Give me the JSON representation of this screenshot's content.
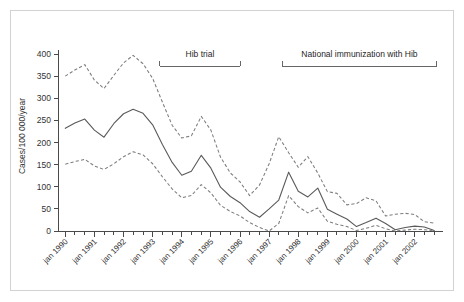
{
  "figure": {
    "background_color": "#ffffff",
    "frame_color": "#d2d2d2"
  },
  "chart_data": {
    "type": "line",
    "title": "",
    "subtitle": "",
    "xlabel": "",
    "ylabel": "Cases/100 000/year",
    "ylim": [
      0,
      400
    ],
    "yticks": [
      0,
      50,
      100,
      150,
      200,
      250,
      300,
      350,
      400
    ],
    "ytick_labels": [
      "0",
      "50",
      "100",
      "150",
      "200",
      "250",
      "300",
      "350",
      "400"
    ],
    "grid": false,
    "legend": "none",
    "x_major_labels": [
      "jan 1990",
      "jan 1991",
      "jan 1992",
      "jan 1993",
      "jan 1994",
      "jan 1995",
      "jan 1996",
      "jan 1997",
      "jan 1998",
      "jan 1999",
      "jan 2000",
      "jan 2001",
      "jan 2002"
    ],
    "x": [
      1990.0,
      1990.33,
      1990.67,
      1991.0,
      1991.33,
      1991.67,
      1992.0,
      1992.33,
      1992.67,
      1993.0,
      1993.33,
      1993.67,
      1994.0,
      1994.33,
      1994.67,
      1995.0,
      1995.33,
      1995.67,
      1996.0,
      1996.33,
      1996.67,
      1997.0,
      1997.33,
      1997.67,
      1998.0,
      1998.33,
      1998.67,
      1999.0,
      1999.33,
      1999.67,
      2000.0,
      2000.33,
      2000.67,
      2001.0,
      2001.33,
      2001.67,
      2002.0,
      2002.33,
      2002.67
    ],
    "series": [
      {
        "name": "Upper 95% confidence limit",
        "style": "dashed",
        "color": "#7d7d7d",
        "values": [
          350,
          364,
          376,
          341,
          322,
          352,
          380,
          397,
          378,
          345,
          292,
          239,
          210,
          215,
          259,
          228,
          167,
          131,
          111,
          80,
          104,
          152,
          213,
          177,
          144,
          168,
          131,
          89,
          85,
          59,
          62,
          75,
          68,
          34,
          38,
          40,
          37,
          21,
          18
        ]
      },
      {
        "name": "Point estimate (incidence)",
        "style": "solid",
        "color": "#5a5a5a",
        "values": [
          232,
          244,
          253,
          228,
          212,
          243,
          265,
          275,
          266,
          240,
          196,
          155,
          126,
          135,
          171,
          142,
          99,
          78,
          64,
          44,
          31,
          50,
          70,
          133,
          90,
          77,
          97,
          49,
          38,
          27,
          10,
          19,
          29,
          17,
          3,
          8,
          11,
          9,
          1
        ]
      },
      {
        "name": "Lower 95% confidence limit",
        "style": "dashed",
        "color": "#7d7d7d",
        "values": [
          151,
          157,
          162,
          147,
          139,
          152,
          168,
          179,
          172,
          152,
          123,
          95,
          75,
          80,
          105,
          86,
          58,
          44,
          34,
          19,
          8,
          0,
          17,
          80,
          55,
          41,
          52,
          22,
          15,
          10,
          1,
          6,
          13,
          5,
          0,
          2,
          4,
          3,
          0
        ]
      }
    ],
    "annotations": [
      {
        "id": "hib-trial",
        "label": "Hib trial",
        "x_start": 1993.25,
        "x_end": 1996.0,
        "bracket": true
      },
      {
        "id": "national-immunization",
        "label": "National immunization with Hib",
        "x_start": 1997.45,
        "x_end": 2002.75,
        "bracket": true
      }
    ]
  }
}
